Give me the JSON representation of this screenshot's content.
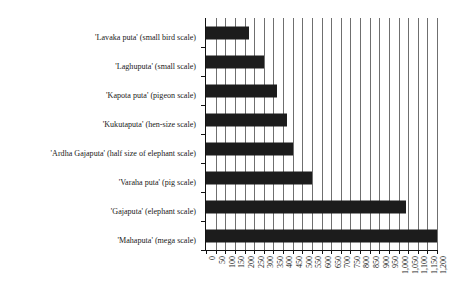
{
  "chart_data": {
    "type": "bar",
    "orientation": "horizontal",
    "title": "",
    "xlabel": "",
    "ylabel": "",
    "xlim": [
      0,
      1200
    ],
    "xtick_step": 50,
    "grid": true,
    "legend": false,
    "bar_color": "#1c1c1c",
    "grid_color": "#6f6f6f",
    "axis_color": "#111111",
    "categories": [
      "'Lavaka puta' (small bird scale)",
      "'Laghuputa' (small scale)",
      "'Kapota puta' (pigeon scale)",
      "'Kukutaputa' (hen-size scale)",
      "'Ardha Gajaputa' (half size of elephant scale)",
      "'Varaha puta' (pig scale)",
      "'Gajaputa' (elephant scale)",
      "'Mahaputa' (mega scale)"
    ],
    "values": [
      225,
      300,
      370,
      420,
      450,
      550,
      1040,
      1200
    ],
    "xticklabels": [
      "0",
      "50",
      "100",
      "150",
      "200",
      "250",
      "300",
      "350",
      "400",
      "450",
      "500",
      "550",
      "600",
      "650",
      "700",
      "750",
      "800",
      "850",
      "900",
      "950",
      "1,000",
      "1,050",
      "1,100",
      "1,150",
      "1,200"
    ],
    "xtickvalues": [
      0,
      50,
      100,
      150,
      200,
      250,
      300,
      350,
      400,
      450,
      500,
      550,
      600,
      650,
      700,
      750,
      800,
      850,
      900,
      950,
      1000,
      1050,
      1100,
      1150,
      1200
    ]
  }
}
